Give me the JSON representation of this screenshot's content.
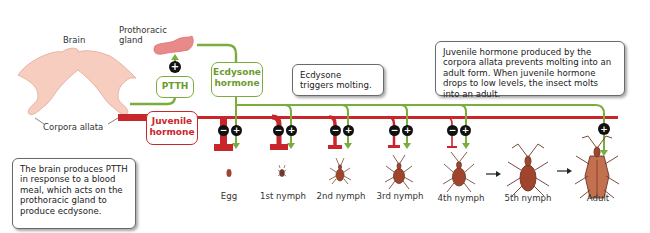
{
  "diagram": {
    "topic": "Hormonal control of molting in a blood-feeding insect",
    "labels": {
      "brain": "Brain",
      "prothoracic_gland": "Prothoracic\ngland",
      "corpora_allata": "Corpora allata"
    },
    "hormone_boxes": {
      "ptth": "PTTH",
      "ecdysone": "Ecdysone\nhormone",
      "juvenile": "Juvenile\nhormone"
    },
    "callouts": {
      "brain_note": "The brain produces PTTH in response to a blood meal, which acts on the prothoracic gland to produce ecdysone.",
      "ecdysone_note": "Ecdysone triggers molting.",
      "juvenile_note": "Juvenile hormone produced by the corpora allata prevents molting into an adult form. When juvenile hormone drops to low levels, the insect molts into an adult."
    },
    "signs": {
      "inhibit": "−",
      "stimulate": "+"
    },
    "stages": [
      {
        "label": "Egg",
        "jh_inhibition": "strong",
        "ecdysone": true
      },
      {
        "label": "1st nymph",
        "jh_inhibition": "high",
        "ecdysone": true
      },
      {
        "label": "2nd nymph",
        "jh_inhibition": "medium",
        "ecdysone": true
      },
      {
        "label": "3rd nymph",
        "jh_inhibition": "lower",
        "ecdysone": true
      },
      {
        "label": "4th nymph",
        "jh_inhibition": "low",
        "ecdysone": true
      },
      {
        "label": "5th nymph",
        "jh_inhibition": "none",
        "ecdysone": true
      },
      {
        "label": "Adult",
        "jh_inhibition": "none",
        "ecdysone": false
      }
    ],
    "colors": {
      "ecdysone_green": "#7aac3e",
      "juvenile_red": "#c8262b",
      "gland_pink": "#e98a8a",
      "brain_pink": "#f6cdbf",
      "insect_brown": "#a0442c"
    }
  }
}
